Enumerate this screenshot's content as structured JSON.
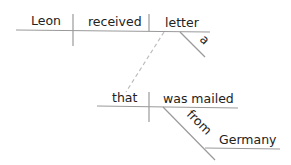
{
  "diagram": {
    "type": "sentence-diagram",
    "colors": {
      "line": "#9a9a9a",
      "text": "#222222"
    },
    "main_clause": {
      "subject": "Leon",
      "verb": "received",
      "object": "letter",
      "object_modifier": "a"
    },
    "relative_clause": {
      "subject": "that",
      "verb": "was mailed",
      "preposition": "from",
      "prep_object": "Germany"
    }
  }
}
